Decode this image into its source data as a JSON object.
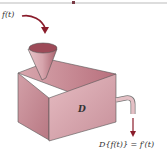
{
  "diagram": {
    "input_label": "f(t)",
    "box_label": "D",
    "output_label": "D{f(t)} = f′(t)",
    "colors": {
      "box_face": "#d9a9b0",
      "box_top": "#c88e97",
      "box_side": "#c4848e",
      "arrow": "#8a1c2b",
      "rule": "#bbbbbb"
    }
  }
}
